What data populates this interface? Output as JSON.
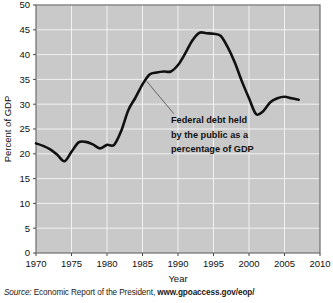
{
  "figure": {
    "source_prefix": "Source:",
    "source_body": " Economic Report of the President, ",
    "source_url": "www.gpoaccess.gov/eop/"
  },
  "chart_data": {
    "type": "line",
    "title": "",
    "xlabel": "Year",
    "ylabel": "Percent of GDP",
    "xlim": [
      1970,
      2010
    ],
    "ylim": [
      0,
      50
    ],
    "grid": true,
    "legend": "none",
    "x_ticks": [
      1970,
      1975,
      1980,
      1985,
      1990,
      1995,
      2000,
      2005,
      2010
    ],
    "y_ticks": [
      0,
      5,
      10,
      15,
      20,
      25,
      30,
      35,
      40,
      45,
      50
    ],
    "plot_bg_color": "#c9c9c9",
    "grid_color": "#f2f2f2",
    "line_color": "#111111",
    "annotations": [
      {
        "text_lines": [
          "Federal debt held",
          "by the public as a",
          "percentage of GDP"
        ],
        "leader_from_year": 1985.6,
        "leader_from_value": 34.6,
        "leader_to_year": 1989.4,
        "leader_to_value": 28.1
      }
    ],
    "series": [
      {
        "name": "Federal debt held by the public as a percentage of GDP",
        "x": [
          1970,
          1971,
          1972,
          1973,
          1974,
          1975,
          1976,
          1977,
          1978,
          1979,
          1980,
          1981,
          1982,
          1983,
          1984,
          1985,
          1986,
          1987,
          1988,
          1989,
          1990,
          1991,
          1992,
          1993,
          1994,
          1995,
          1996,
          1997,
          1998,
          1999,
          2000,
          2001,
          2002,
          2003,
          2004,
          2005,
          2006,
          2007
        ],
        "values": [
          22.1,
          21.6,
          20.9,
          19.8,
          18.5,
          20.4,
          22.3,
          22.4,
          21.9,
          21.1,
          21.8,
          21.8,
          24.6,
          28.8,
          31.3,
          34.0,
          36.0,
          36.4,
          36.6,
          36.6,
          37.9,
          40.2,
          42.8,
          44.4,
          44.3,
          44.2,
          43.8,
          41.5,
          38.4,
          34.6,
          31.2,
          28.0,
          28.6,
          30.4,
          31.2,
          31.5,
          31.2,
          30.9
        ]
      }
    ]
  }
}
